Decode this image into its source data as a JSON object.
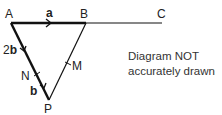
{
  "diagram": {
    "points": {
      "A": {
        "label": "A"
      },
      "B": {
        "label": "B"
      },
      "C": {
        "label": "C"
      },
      "P": {
        "label": "P"
      },
      "M": {
        "label": "M"
      },
      "N": {
        "label": "N"
      }
    },
    "vectors": {
      "AB": {
        "label": "a"
      },
      "AN": {
        "label_prefix": "2",
        "label_vec": "b"
      },
      "NP": {
        "label": "b"
      }
    },
    "note": {
      "line1": "Diagram NOT",
      "line2": "accurately drawn"
    },
    "colors": {
      "line": "#111111",
      "text": "#222222"
    }
  }
}
